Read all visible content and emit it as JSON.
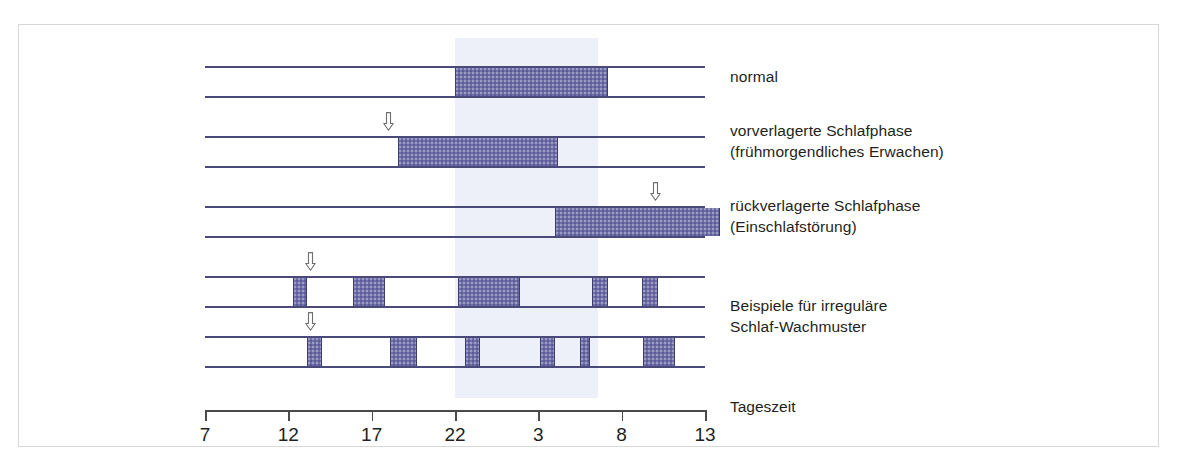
{
  "figure": {
    "kind": "sleep-phase-diagram",
    "background_color": "#ffffff",
    "frame_color": "#d8d8d8",
    "night_band_color": "#eef0f9",
    "rail_color": "#4a4a7a",
    "block_color": "#7070aa",
    "block_border_color": "#3c3c6e",
    "text_color": "#231f20"
  },
  "chart_data": {
    "type": "bar",
    "title": "",
    "xlabel": "Tageszeit",
    "ylabel": "",
    "x_tick_labels": [
      "7",
      "12",
      "17",
      "22",
      "3",
      "8",
      "13"
    ],
    "x_tick_hours": [
      7,
      12,
      17,
      22,
      27,
      32,
      37
    ],
    "xlim": [
      7,
      37
    ],
    "grid": false,
    "legend": "none",
    "night_band_hours": [
      22,
      30.6
    ],
    "series": [
      {
        "name": "normal",
        "label": "normal",
        "marker_hour": null,
        "blocks": [
          [
            22.0,
            31.2
          ]
        ]
      },
      {
        "name": "vorverlagerte-schlafphase",
        "label": "vorverlagerte Schlafphase\n(frühmorgendliches Erwachen)",
        "marker_hour": 18.0,
        "blocks": [
          [
            18.6,
            28.2
          ]
        ]
      },
      {
        "name": "rueckverlagerte-schlafphase",
        "label": "rückverlagerte Schlafphase\n(Einschlafstörung)",
        "marker_hour": 34.0,
        "blocks": [
          [
            28.0,
            37.9
          ]
        ]
      },
      {
        "name": "irregulaer-1",
        "label": "",
        "marker_hour": 13.3,
        "blocks": [
          [
            12.3,
            13.1
          ],
          [
            15.9,
            17.8
          ],
          [
            22.2,
            25.9
          ],
          [
            30.2,
            31.2
          ],
          [
            33.2,
            34.2
          ]
        ]
      },
      {
        "name": "irregulaer-2",
        "label": "Beispiele für irreguläre\nSchlaf-Wachmuster",
        "marker_hour": 13.3,
        "blocks": [
          [
            13.1,
            14.0
          ],
          [
            18.1,
            19.7
          ],
          [
            22.6,
            23.5
          ],
          [
            27.1,
            28.0
          ],
          [
            29.5,
            30.1
          ],
          [
            33.3,
            35.2
          ]
        ]
      }
    ]
  },
  "captions": {
    "row1": "normal",
    "row2": "vorverlagerte Schlafphase\n(frühmorgendliches Erwachen)",
    "row3": "rückverlagerte Schlafphase\n(Einschlafstörung)",
    "row45": "Beispiele für irreguläre\nSchlaf-Wachmuster",
    "axis": "Tageszeit"
  },
  "icons": {
    "marker": "down-arrow-icon"
  }
}
